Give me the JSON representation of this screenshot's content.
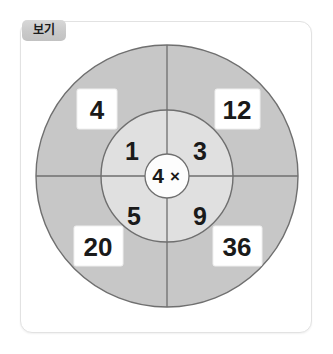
{
  "card": {
    "badge_label": "보기"
  },
  "diagram": {
    "type": "concentric-target",
    "center": {
      "value": "4",
      "operator": "×",
      "operator_name": "multiplication-sign"
    },
    "inner_ring": {
      "description": "multiplier values",
      "quadrants": [
        {
          "position": "top-left",
          "value": "1"
        },
        {
          "position": "top-right",
          "value": "3"
        },
        {
          "position": "bottom-left",
          "value": "5"
        },
        {
          "position": "bottom-right",
          "value": "9"
        }
      ]
    },
    "outer_ring": {
      "description": "product values in white boxes",
      "quadrants": [
        {
          "position": "top-left",
          "value": "4"
        },
        {
          "position": "top-right",
          "value": "12"
        },
        {
          "position": "bottom-left",
          "value": "20"
        },
        {
          "position": "bottom-right",
          "value": "36"
        }
      ]
    },
    "colors": {
      "outer_ring_fill": "#c7c7c7",
      "inner_ring_fill": "#e0e0e0",
      "center_fill": "#fdfdfd",
      "stroke": "#6b6b6b",
      "label_box_fill": "#ffffff",
      "card_border": "#e2e2e2",
      "badge_fill": "#c9c9c9",
      "text": "#1a1a1a"
    },
    "geometry": {
      "center_x": 167,
      "center_y": 176,
      "outer_radius": 131,
      "middle_radius": 66,
      "center_radius": 22
    }
  }
}
